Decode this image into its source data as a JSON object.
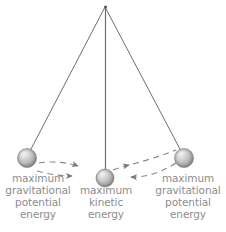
{
  "figure": {
    "type": "physics-diagram",
    "background_color": "#ffffff",
    "line_color": "#6e6e6e",
    "text_color": "#8d8d8d",
    "bob_color": "#b9b9b9",
    "bob_highlight_color": "#f2f2f2"
  },
  "pivot": {
    "x": 105,
    "y": 7
  },
  "strings": [
    {
      "name": "string-left",
      "x1": 105,
      "y1": 7,
      "x2": 30,
      "y2": 151
    },
    {
      "name": "string-middle",
      "x1": 105,
      "y1": 7,
      "x2": 105,
      "y2": 172
    },
    {
      "name": "string-right",
      "x1": 105,
      "y1": 7,
      "x2": 181,
      "y2": 151
    }
  ],
  "bobs": [
    {
      "name": "bob-left",
      "cx": 27,
      "cy": 158,
      "r": 9.5,
      "state": "maximum gravitational potential energy"
    },
    {
      "name": "bob-middle",
      "cx": 105,
      "cy": 178,
      "r": 9.0,
      "state": "maximum kinetic energy"
    },
    {
      "name": "bob-right",
      "cx": 184,
      "cy": 158,
      "r": 9.5,
      "state": "maximum gravitational potential energy"
    }
  ],
  "motion_arcs": [
    {
      "name": "arc-upper-swing",
      "direction": "left-to-right",
      "arrowheads": 2
    },
    {
      "name": "arc-lower-swing",
      "direction": "right-to-left",
      "arrowheads": 2
    }
  ],
  "captions": {
    "left": {
      "name": "caption-max-gravitational-potential-energy-left",
      "lines": [
        "maximum",
        "gravitational",
        "potential",
        "energy"
      ],
      "line1": "maximum",
      "line2": "gravitational",
      "line3": "potential",
      "line4": "energy"
    },
    "middle": {
      "name": "caption-max-kinetic-energy",
      "lines": [
        "maximum",
        "kinetic",
        "energy"
      ],
      "line1": "maximum",
      "line2": "kinetic",
      "line3": "energy"
    },
    "right": {
      "name": "caption-max-gravitational-potential-energy-right",
      "lines": [
        "maximum",
        "gravitational",
        "potential",
        "energy"
      ],
      "line1": "maximum",
      "line2": "gravitational",
      "line3": "potential",
      "line4": "energy"
    }
  }
}
